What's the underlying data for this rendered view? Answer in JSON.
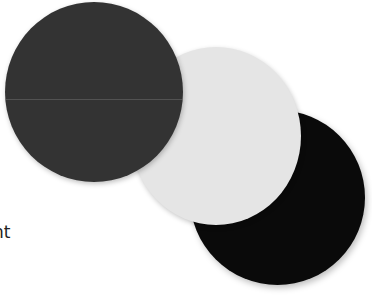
{
  "scene": {
    "background": "#ffffff",
    "discs": [
      {
        "name": "dark-gray-disc",
        "color": "#333333"
      },
      {
        "name": "light-gray-disc",
        "color": "#e5e5e5"
      },
      {
        "name": "black-disc",
        "color": "#0a0a0a"
      }
    ]
  },
  "caption": {
    "fragment": "nt"
  }
}
